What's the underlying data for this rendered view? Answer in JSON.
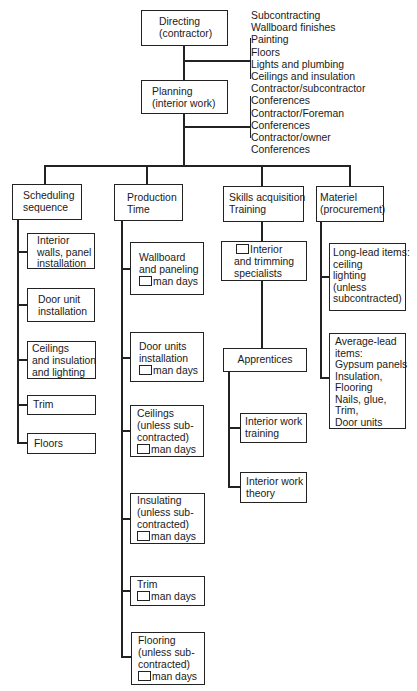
{
  "top": {
    "directing": {
      "lines": [
        "Directing",
        "(contractor)"
      ]
    },
    "planning": {
      "lines": [
        "Planning",
        "(interior work)"
      ]
    },
    "notes": [
      "Subcontracting",
      "Wallboard finishes",
      "Painting",
      "Floors",
      "Lights and plumbing",
      "Ceilings and insulation",
      "Contractor/subcontractor",
      "Conferences",
      "Contractor/Foreman",
      "Conferences",
      "Contractor/owner",
      "Conferences"
    ]
  },
  "branches": {
    "scheduling": {
      "header": [
        "Scheduling",
        "sequence"
      ],
      "items": [
        [
          "Interior",
          "walls, panel",
          "installation"
        ],
        [
          "Door unit",
          "installation"
        ],
        [
          "Ceilings",
          "and insulation",
          "and lighting"
        ],
        [
          "Trim"
        ],
        [
          "Floors"
        ]
      ]
    },
    "production": {
      "header": [
        "Production",
        "Time"
      ],
      "man_days_label": "man days",
      "items": [
        [
          "Wallboard",
          "and paneling"
        ],
        [
          "Door units",
          "installation"
        ],
        [
          "Ceilings",
          "(unless sub-",
          "contracted)"
        ],
        [
          "Insulating",
          "(unless sub-",
          "contracted)"
        ],
        [
          "Trim"
        ],
        [
          "Flooring",
          "(unless sub-",
          "contracted)"
        ]
      ]
    },
    "skills": {
      "header": [
        "Skills acquisition",
        "Training"
      ],
      "specialists": [
        "Interior",
        "and trimming",
        "specialists"
      ],
      "apprentices": "Apprentices",
      "apprentice_items": [
        [
          "Interior work",
          "training"
        ],
        [
          "Interior work",
          "theory"
        ]
      ]
    },
    "materiel": {
      "header": [
        "Materiel",
        "(procurement)"
      ],
      "items": [
        [
          "Long-lead items:",
          "ceiling",
          "lighting",
          "(unless",
          "subcontracted)"
        ],
        [
          "Average-lead",
          "items:",
          "Gypsum panels",
          "Insulation,",
          "Flooring",
          "Nails, glue,",
          "Trim,",
          "Door units"
        ]
      ]
    }
  }
}
